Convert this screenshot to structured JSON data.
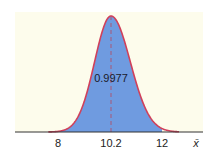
{
  "chart_data": {
    "type": "area",
    "title": "",
    "xlabel": "x̄",
    "ylabel": "",
    "distribution": "normal",
    "mean": 10.2,
    "shaded_interval": [
      8,
      12
    ],
    "shaded_probability": 0.9977,
    "x_ticks": [
      8,
      10.2,
      12
    ],
    "x_tick_labels": [
      "8",
      "10.2",
      "12"
    ],
    "annotations": [
      "0.9977"
    ],
    "mean_line": "dashed",
    "grid": false,
    "legend": null
  },
  "labels": {
    "tick_8": "8",
    "tick_mean": "10.2",
    "tick_12": "12",
    "area": "0.9977",
    "axis": "x̄"
  },
  "colors": {
    "panel": "#fdfcec",
    "fill": "#6f9be0",
    "curve": "#d0405a",
    "mean_line": "#b8485a",
    "axis": "#333333"
  }
}
